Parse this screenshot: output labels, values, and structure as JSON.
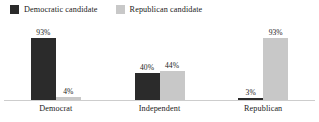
{
  "chart_data": {
    "type": "bar",
    "title": "",
    "subtitle": "",
    "xlabel": "",
    "ylabel": "",
    "ylim": [
      0,
      100
    ],
    "grid": false,
    "legend_position": "top-left",
    "orientation": "vertical",
    "grouped": true,
    "value_label_suffix": "%",
    "categories": [
      "Democrat",
      "Independent",
      "Republican"
    ],
    "series": [
      {
        "name": "Democratic candidate",
        "color": "#2b2b2b",
        "values": [
          93,
          40,
          3
        ],
        "value_labels": [
          "93%",
          "40%",
          "3%"
        ]
      },
      {
        "name": "Republican candidate",
        "color": "#c8c8c8",
        "values": [
          4,
          44,
          93
        ],
        "value_labels": [
          "4%",
          "44%",
          "93%"
        ]
      }
    ],
    "axis_color": "#cdcdcd"
  },
  "legend": {
    "entries": [
      {
        "label": "Democratic candidate",
        "swatch": "#2b2b2b"
      },
      {
        "label": "Republican candidate",
        "swatch": "#c8c8c8"
      }
    ]
  }
}
